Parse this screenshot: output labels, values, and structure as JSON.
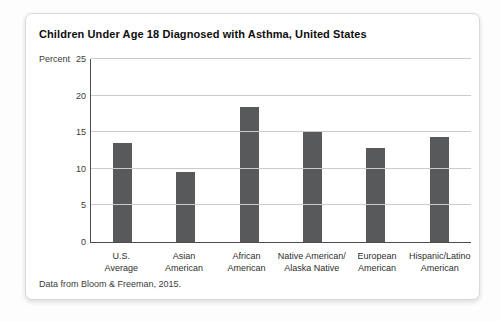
{
  "card": {
    "background": "#ffffff",
    "border_color": "#d9d9d9"
  },
  "chart_data": {
    "type": "bar",
    "title": "Children Under Age 18 Diagnosed with Asthma, United States",
    "unit_label": "Percent",
    "categories": [
      "U.S. Average",
      "Asian American",
      "African American",
      "Native American/Alaska Native",
      "European American",
      "Hispanic/Latino American"
    ],
    "categories_lines": [
      [
        "U.S.",
        "Average"
      ],
      [
        "Asian",
        "American"
      ],
      [
        "African",
        "American"
      ],
      [
        "Native American/",
        "Alaska Native"
      ],
      [
        "European",
        "American"
      ],
      [
        "Hispanic/Latino",
        "American"
      ]
    ],
    "values": [
      13.5,
      9.6,
      18.5,
      15.1,
      12.8,
      14.3
    ],
    "xlabel": "",
    "ylabel": "Percent",
    "ylim": [
      0,
      25
    ],
    "yticks": [
      0,
      5,
      10,
      15,
      20,
      25
    ],
    "grid": true,
    "legend": "none",
    "bar_color": "#58595b",
    "gridline_color": "#cbcbcb",
    "axis_color": "#4c4c4e"
  },
  "footer": {
    "source": "Data from Bloom & Freeman, 2015."
  }
}
